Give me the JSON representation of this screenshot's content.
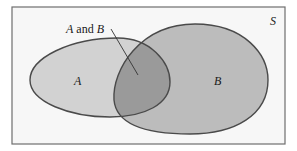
{
  "diagram": {
    "type": "venn",
    "universe_label": "S",
    "sets": [
      {
        "label": "A"
      },
      {
        "label": "B"
      }
    ],
    "intersection_label": {
      "a": "A",
      "and": " and ",
      "b": "B"
    },
    "colors": {
      "frame": "#6e6e6e",
      "set_a_fill": "#d2d2d2",
      "set_b_fill": "#bcbcbc",
      "intersection_fill": "#9a9a9a",
      "outline": "#4a4a4a"
    }
  }
}
